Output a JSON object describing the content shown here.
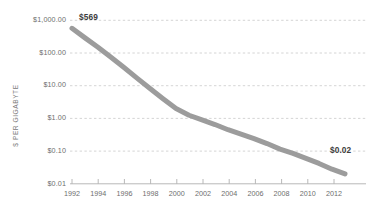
{
  "chart_data": {
    "type": "line",
    "title": "",
    "subtitle": "",
    "xlabel": "",
    "ylabel": "$ PER GIGABYTE",
    "yscale": "log",
    "ylim": [
      0.01,
      1000
    ],
    "xlim": [
      1992,
      2013
    ],
    "grid": true,
    "legend": false,
    "legend_position": "none",
    "line_color": "#9c9c9c",
    "line_width": 5,
    "y_tick_labels": [
      "$1,000.00",
      "$100.00",
      "$10.00",
      "$1.00",
      "$0.10",
      "$0.01"
    ],
    "y_tick_values": [
      1000,
      100,
      10,
      1,
      0.1,
      0.01
    ],
    "x_tick_labels": [
      "1992",
      "1994",
      "1996",
      "1998",
      "2000",
      "2002",
      "2004",
      "2006",
      "2008",
      "2010",
      "2012"
    ],
    "x_tick_values": [
      1992,
      1994,
      1996,
      1998,
      2000,
      2002,
      2004,
      2006,
      2008,
      2010,
      2012
    ],
    "x": [
      1992,
      1993,
      1994,
      1995,
      1996,
      1997,
      1998,
      1999,
      2000,
      2001,
      2002,
      2003,
      2004,
      2005,
      2006,
      2007,
      2008,
      2009,
      2010,
      2011,
      2012,
      2013
    ],
    "values": [
      569,
      290,
      150,
      74,
      36,
      17,
      8.2,
      4.0,
      2.0,
      1.25,
      0.9,
      0.65,
      0.45,
      0.33,
      0.24,
      0.17,
      0.115,
      0.085,
      0.06,
      0.042,
      0.028,
      0.02
    ],
    "annotations": [
      {
        "label": "$569",
        "x": 1992,
        "y": 569
      },
      {
        "label": "$0.02",
        "x": 2013,
        "y": 0.02
      }
    ]
  },
  "axis": {
    "y_title": "$ PER GIGABYTE"
  }
}
